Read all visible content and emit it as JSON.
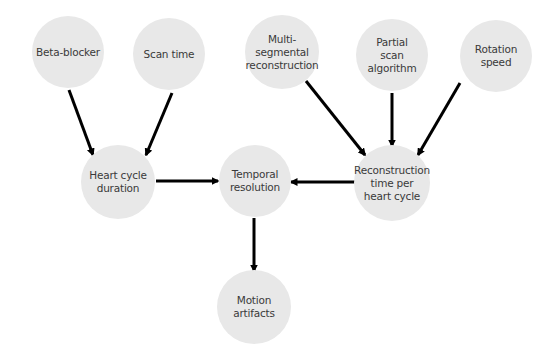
{
  "diagram": {
    "background": "#ffffff",
    "node_fill": "#e8e8e8",
    "text_color": "#3a3a3a",
    "edge_color": "#000000",
    "nodes": [
      {
        "id": "beta_blocker",
        "label": "Beta-blocker",
        "cx": 68,
        "cy": 52,
        "r": 36
      },
      {
        "id": "scan_time",
        "label": "Scan time",
        "cx": 169,
        "cy": 54,
        "r": 36
      },
      {
        "id": "multi_segmental",
        "label": "Multi-\nsegmental\nreconstruction",
        "cx": 282,
        "cy": 52,
        "r": 37
      },
      {
        "id": "partial_scan",
        "label": "Partial\nscan\nalgorithm",
        "cx": 392,
        "cy": 55,
        "r": 36
      },
      {
        "id": "rotation_speed",
        "label": "Rotation\nspeed",
        "cx": 496,
        "cy": 56,
        "r": 36
      },
      {
        "id": "heart_cycle",
        "label": "Heart cycle\nduration",
        "cx": 118,
        "cy": 182,
        "r": 37
      },
      {
        "id": "temporal_resolution",
        "label": "Temporal\nresolution",
        "cx": 255,
        "cy": 181,
        "r": 36
      },
      {
        "id": "reconstruction_time",
        "label": "Reconstruction\ntime per\nheart cycle",
        "cx": 392,
        "cy": 183,
        "r": 38
      },
      {
        "id": "motion_artifacts",
        "label": "Motion\nartifacts",
        "cx": 254,
        "cy": 307,
        "r": 37
      }
    ],
    "edges": [
      {
        "from": "beta_blocker",
        "to": "heart_cycle",
        "x1": 69,
        "y1": 90,
        "x2": 93,
        "y2": 155
      },
      {
        "from": "scan_time",
        "to": "heart_cycle",
        "x1": 172,
        "y1": 93,
        "x2": 146,
        "y2": 155
      },
      {
        "from": "heart_cycle",
        "to": "temporal_resolution",
        "x1": 156,
        "y1": 181,
        "x2": 218,
        "y2": 181
      },
      {
        "from": "reconstruction_time",
        "to": "temporal_resolution",
        "x1": 355,
        "y1": 182,
        "x2": 291,
        "y2": 182
      },
      {
        "from": "multi_segmental",
        "to": "reconstruction_time",
        "x1": 306,
        "y1": 81,
        "x2": 365,
        "y2": 155
      },
      {
        "from": "partial_scan",
        "to": "reconstruction_time",
        "x1": 392,
        "y1": 93,
        "x2": 392,
        "y2": 146
      },
      {
        "from": "rotation_speed",
        "to": "reconstruction_time",
        "x1": 460,
        "y1": 83,
        "x2": 418,
        "y2": 155
      },
      {
        "from": "temporal_resolution",
        "to": "motion_artifacts",
        "x1": 254,
        "y1": 218,
        "x2": 254,
        "y2": 271
      }
    ]
  }
}
